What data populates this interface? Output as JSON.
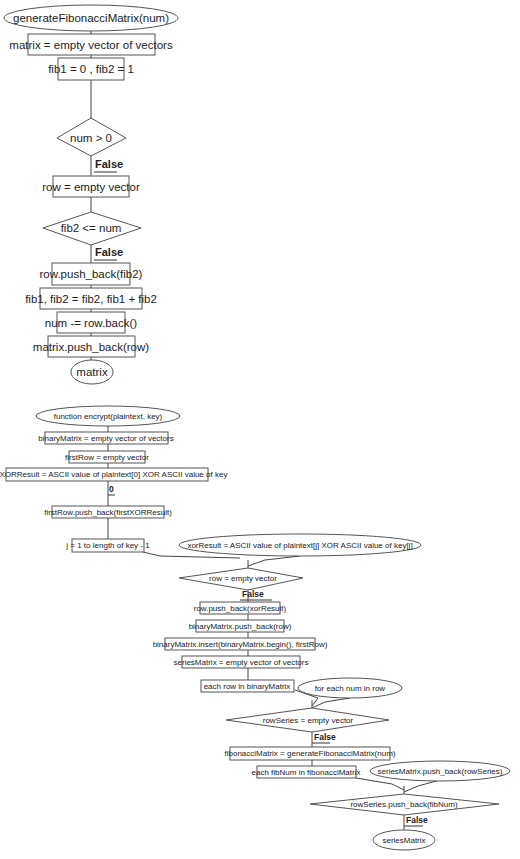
{
  "colors": {
    "background": "#ffffff",
    "stroke": "#555555",
    "text": "#222222"
  },
  "flowchart1": {
    "start": "generateFibonacciMatrix(num)",
    "init_matrix": "matrix = empty vector of vectors",
    "init_fib": "fib1 = 0 , fib2 = 1",
    "cond_num": "num > 0",
    "edge_num_false": "False",
    "init_row": "row = empty vector",
    "cond_fib2": "fib2 <= num",
    "edge_fib2_false": "False",
    "push_fib2": "row.push_back(fib2)",
    "update_fib": "fib1, fib2 = fib2, fib1 + fib2",
    "decrement_num": "num -= row.back()",
    "push_row": "matrix.push_back(row)",
    "end": "matrix"
  },
  "flowchart2": {
    "start": "function encrypt(plaintext, key)",
    "init_binary_matrix": "binaryMatrix = empty vector of vectors",
    "init_first_row": "firstRow = empty vector",
    "first_xor": "firstXORResult = ASCII value of plaintext[0] XOR ASCII value of key",
    "edge_zero": "0",
    "push_first_xor": "firstRow.push_back(firstXORResult)",
    "loop_j": "j = 1 to length of key - 1",
    "xor_result": "xorResult = ASCII value of plaintext[j] XOR ASCII value of key[j]",
    "cond_row": "row = empty vector",
    "edge_row_false": "False",
    "push_xor": "row.push_back(xorResult)",
    "push_binary_row": "binaryMatrix.push_back(row)",
    "insert_first_row": "binaryMatrix.insert(binaryMatrix.begin(), firstRow)",
    "init_series_matrix": "seriesMatrix = empty vector of vectors",
    "loop_rows": "each row in binaryMatrix",
    "loop_nums": "for each num in row",
    "cond_row_series": "rowSeries = empty vector",
    "edge_row_series_false": "False",
    "fib_matrix": "fibonacciMatrix = generateFibonacciMatrix(num)",
    "loop_fib_nums": "each fibNum in fibonacciMatrix",
    "push_row_series": "seriesMatrix.push_back(rowSeries)",
    "cond_push_fib": "rowSeries.push_back(fibNum)",
    "edge_push_fib_false": "False",
    "end": "seriesMatrix"
  }
}
